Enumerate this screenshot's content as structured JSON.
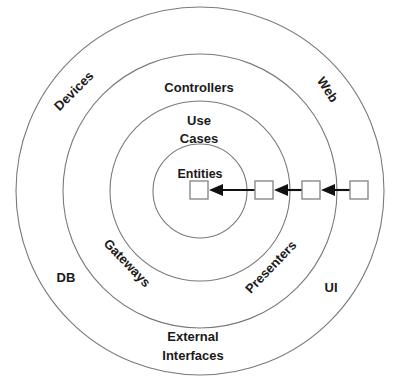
{
  "diagram": {
    "center": {
      "x": 200,
      "y": 191
    },
    "stroke_color": "#7a7a7a",
    "text_color": "#1a1a1a",
    "arrow_color": "#111111",
    "box_fill": "#ffffff",
    "background": "#ffffff",
    "rings": [
      {
        "name": "outer-ring",
        "radius": 184,
        "label_primary": "External\nInterfaces"
      },
      {
        "name": "controllers-ring",
        "radius": 137,
        "label_primary": "Controllers"
      },
      {
        "name": "use-cases-ring",
        "radius": 90,
        "label_primary": "Use Cases"
      },
      {
        "name": "entities-ring",
        "radius": 47,
        "label_primary": "Entities"
      }
    ],
    "labels": {
      "devices": "Devices",
      "web": "Web",
      "controllers": "Controllers",
      "use": "Use",
      "cases": "Cases",
      "entities": "Entities",
      "gateways": "Gateways",
      "presenters": "Presenters",
      "db": "DB",
      "ui": "UI",
      "external": "External",
      "interfaces": "Interfaces"
    },
    "flow": {
      "direction": "right-to-left",
      "description": "Control flows inward toward Entities",
      "boxes": [
        {
          "name": "entities-box",
          "x": 190,
          "y": 181,
          "w": 18,
          "h": 18
        },
        {
          "name": "use-cases-box",
          "x": 255,
          "y": 181,
          "w": 18,
          "h": 18
        },
        {
          "name": "controllers-box",
          "x": 302,
          "y": 181,
          "w": 18,
          "h": 18
        },
        {
          "name": "external-box",
          "x": 350,
          "y": 181,
          "w": 18,
          "h": 18
        }
      ],
      "arrows": [
        {
          "name": "arrow-to-entities",
          "from_x": 255,
          "to_x": 209,
          "y": 190
        },
        {
          "name": "arrow-to-use-cases",
          "from_x": 302,
          "to_x": 274,
          "y": 190
        },
        {
          "name": "arrow-to-controllers",
          "from_x": 350,
          "to_x": 321,
          "y": 190
        }
      ]
    }
  }
}
